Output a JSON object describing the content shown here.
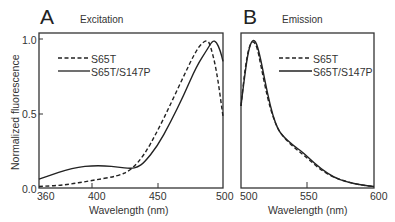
{
  "chart_data": [
    {
      "type": "line",
      "panel": "A",
      "title": "Excitation",
      "xlabel": "Wavelength (nm)",
      "ylabel": "Normalized fluorescence",
      "xlim": [
        360,
        500
      ],
      "ylim": [
        0.0,
        1.0
      ],
      "xticks": [
        360,
        400,
        450,
        500
      ],
      "yticks": [
        0.0,
        0.5,
        1.0
      ],
      "legend": [
        "S65T",
        "S65T/S147P"
      ],
      "series": [
        {
          "name": "S65T",
          "style": "dashed",
          "x": [
            360,
            380,
            400,
            420,
            430,
            440,
            450,
            460,
            470,
            480,
            485,
            488,
            490,
            495,
            500
          ],
          "y": [
            0.01,
            0.02,
            0.05,
            0.08,
            0.12,
            0.22,
            0.38,
            0.56,
            0.75,
            0.93,
            0.98,
            0.99,
            0.97,
            0.8,
            0.48
          ]
        },
        {
          "name": "S65T/S147P",
          "style": "solid",
          "x": [
            360,
            370,
            380,
            390,
            400,
            410,
            420,
            430,
            435,
            440,
            450,
            460,
            470,
            480,
            488,
            492,
            495,
            498,
            500
          ],
          "y": [
            0.06,
            0.09,
            0.12,
            0.14,
            0.15,
            0.15,
            0.14,
            0.13,
            0.14,
            0.17,
            0.28,
            0.44,
            0.62,
            0.82,
            0.93,
            0.99,
            0.98,
            0.92,
            0.85
          ]
        }
      ]
    },
    {
      "type": "line",
      "panel": "B",
      "title": "Emission",
      "xlabel": "Wavelength (nm)",
      "ylabel": "Normalized fluorescence",
      "xlim": [
        500,
        600
      ],
      "ylim": [
        0.0,
        1.0
      ],
      "xticks": [
        500,
        550,
        600
      ],
      "legend": [
        "S65T",
        "S65T/S147P"
      ],
      "series": [
        {
          "name": "S65T",
          "style": "dashed",
          "x": [
            500,
            503,
            506,
            509,
            512,
            515,
            520,
            525,
            530,
            540,
            550,
            560,
            570,
            580,
            590,
            600
          ],
          "y": [
            0.55,
            0.8,
            0.95,
            0.99,
            0.95,
            0.82,
            0.6,
            0.45,
            0.36,
            0.27,
            0.2,
            0.12,
            0.07,
            0.04,
            0.02,
            0.01
          ]
        },
        {
          "name": "S65T/S147P",
          "style": "solid",
          "x": [
            500,
            502,
            505,
            508,
            511,
            514,
            518,
            522,
            526,
            530,
            540,
            545,
            550,
            560,
            570,
            580,
            590,
            600
          ],
          "y": [
            0.55,
            0.7,
            0.9,
            0.99,
            0.99,
            0.9,
            0.72,
            0.55,
            0.43,
            0.36,
            0.28,
            0.25,
            0.21,
            0.13,
            0.07,
            0.04,
            0.02,
            0.01
          ]
        }
      ]
    }
  ],
  "panelA": {
    "letter": "A",
    "title": "Excitation",
    "ylabel": "Normalized fluorescence",
    "xlabel": "Wavelength (nm)",
    "yticks": [
      "1.0",
      "0.5",
      "0.0"
    ],
    "xticks": [
      "360",
      "400",
      "450",
      "500"
    ],
    "legend": {
      "dashed": "S65T",
      "solid": "S65T/S147P"
    }
  },
  "panelB": {
    "letter": "B",
    "title": "Emission",
    "xlabel": "Wavelength (nm)",
    "xticks": [
      "500",
      "550",
      "600"
    ],
    "legend": {
      "dashed": "S65T",
      "solid": "S65T/S147P"
    }
  },
  "colors": {
    "line": "#222222",
    "axis": "#333333"
  }
}
